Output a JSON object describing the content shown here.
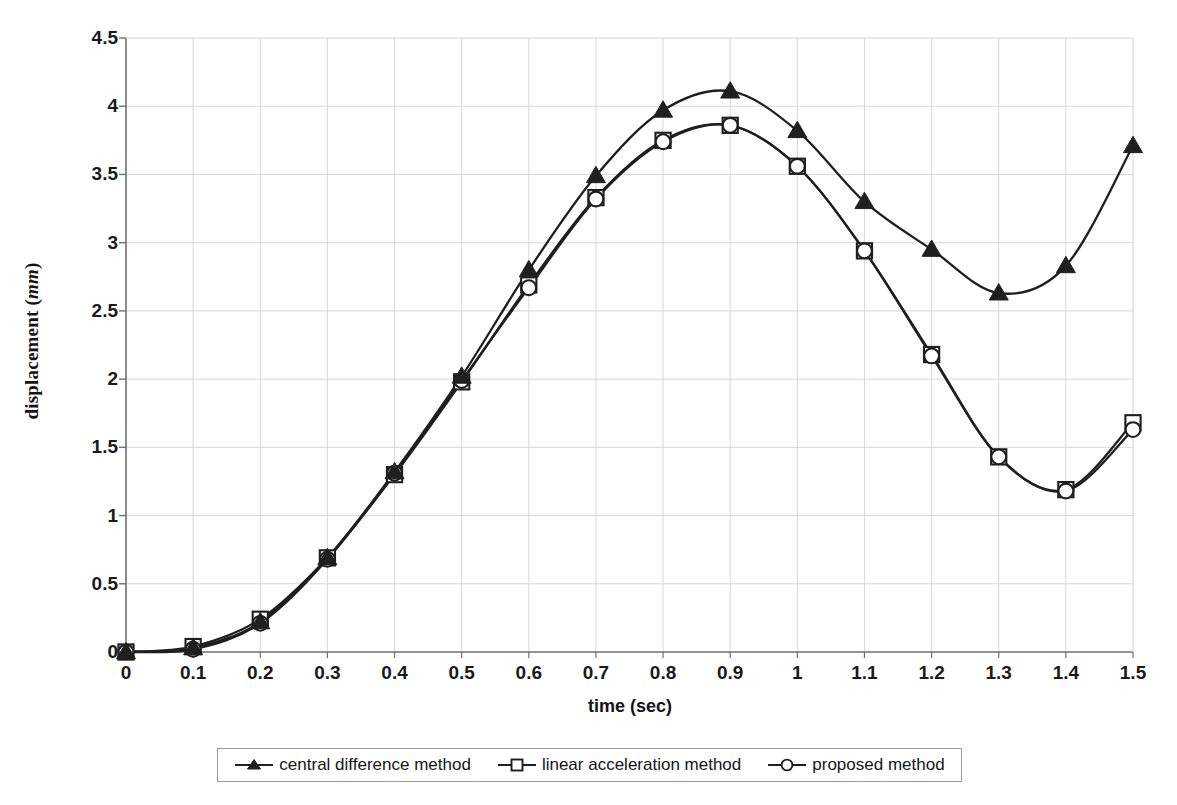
{
  "chart_data": {
    "type": "line",
    "title": "",
    "xlabel": "time (sec)",
    "ylabel_text": "displacement (",
    "ylabel_unit": "mm",
    "ylabel_close": ")",
    "xlim": [
      0,
      1.5
    ],
    "ylim": [
      0,
      4.5
    ],
    "xticks": [
      "0",
      "0.1",
      "0.2",
      "0.3",
      "0.4",
      "0.5",
      "0.6",
      "0.7",
      "0.8",
      "0.9",
      "1",
      "1.1",
      "1.2",
      "1.3",
      "1.4",
      "1.5"
    ],
    "yticks": [
      "0",
      "0.5",
      "1",
      "1.5",
      "2",
      "2.5",
      "3",
      "3.5",
      "4",
      "4.5"
    ],
    "grid": true,
    "legend_position": "bottom",
    "x": [
      0,
      0.1,
      0.2,
      0.3,
      0.4,
      0.5,
      0.6,
      0.7,
      0.8,
      0.9,
      1.0,
      1.1,
      1.2,
      1.3,
      1.4,
      1.5
    ],
    "series": [
      {
        "name": "central difference method",
        "marker": "filled-triangle",
        "color": "#1f1f1f",
        "values": [
          0.0,
          0.03,
          0.22,
          0.69,
          1.32,
          2.02,
          2.8,
          3.49,
          3.97,
          4.11,
          3.82,
          3.3,
          2.95,
          2.63,
          2.83,
          3.71
        ]
      },
      {
        "name": "linear acceleration method",
        "marker": "open-square",
        "color": "#1f1f1f",
        "values": [
          0.0,
          0.04,
          0.24,
          0.69,
          1.3,
          1.98,
          2.69,
          3.33,
          3.75,
          3.86,
          3.56,
          2.94,
          2.18,
          1.43,
          1.19,
          1.68
        ]
      },
      {
        "name": "proposed method",
        "marker": "open-circle",
        "color": "#1f1f1f",
        "values": [
          0.0,
          0.02,
          0.21,
          0.68,
          1.31,
          1.99,
          2.67,
          3.32,
          3.74,
          3.86,
          3.56,
          2.94,
          2.17,
          1.43,
          1.18,
          1.63
        ]
      }
    ]
  },
  "legend": {
    "entries": [
      {
        "label": "central difference method"
      },
      {
        "label": "linear acceleration method"
      },
      {
        "label": "proposed method"
      }
    ]
  },
  "colors": {
    "axis": "#6f6f6f",
    "grid": "#d8d8d8",
    "series": "#1f1f1f",
    "background": "#ffffff"
  }
}
